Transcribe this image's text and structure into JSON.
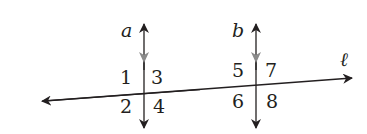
{
  "diagram": {
    "lines": {
      "a": "a",
      "b": "b",
      "transversal": "ℓ"
    },
    "angles": {
      "a1": "1",
      "a2": "2",
      "a3": "3",
      "a4": "4",
      "a5": "5",
      "a6": "6",
      "a7": "7",
      "a8": "8"
    },
    "colors": {
      "line": "#231f20",
      "parallel_marker": "#8a8a8a"
    }
  }
}
